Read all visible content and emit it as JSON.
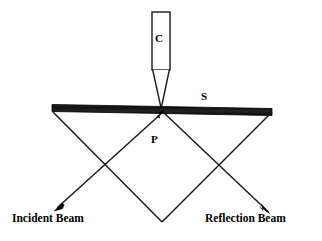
{
  "figure": {
    "background_color": "#ffffff",
    "line_color": "#1a1a1a",
    "surface_color": "#111111",
    "width": 322,
    "height": 241
  },
  "labels": {
    "cantilever": "C",
    "surface": "S",
    "contact_point": "P",
    "incident_beam": "Incident Beam",
    "reflection_beam": "Reflection Beam"
  },
  "geometry": {
    "cantilever_body": {
      "x": 152,
      "y": 12,
      "width": 18,
      "height": 58
    },
    "cantilever_tip": {
      "apex_x": 161,
      "apex_y": 108,
      "base_y": 70
    },
    "surface_bar": {
      "x1": 52,
      "y1": 104,
      "x2": 272,
      "y2": 111,
      "thickness": 7
    },
    "contact_point": {
      "x": 162,
      "y": 112
    },
    "incident_path": {
      "from_x": 272,
      "from_y": 112,
      "via_x": 162,
      "via_y": 222,
      "to_x": 52,
      "to_y": 112
    },
    "reflection_path": {
      "from_x": 52,
      "from_y": 112,
      "via_x": 162,
      "via_y": 222,
      "to_x": 272,
      "to_y": 212
    },
    "left_crossing": {
      "x": 105,
      "y": 165
    },
    "right_crossing": {
      "x": 220,
      "y": 165
    },
    "incident_arrow_tip": {
      "x": 57,
      "y": 208
    },
    "reflection_arrow_tip": {
      "x": 270,
      "y": 214
    },
    "point_arrow_tip": {
      "x": 163,
      "y": 112
    }
  }
}
